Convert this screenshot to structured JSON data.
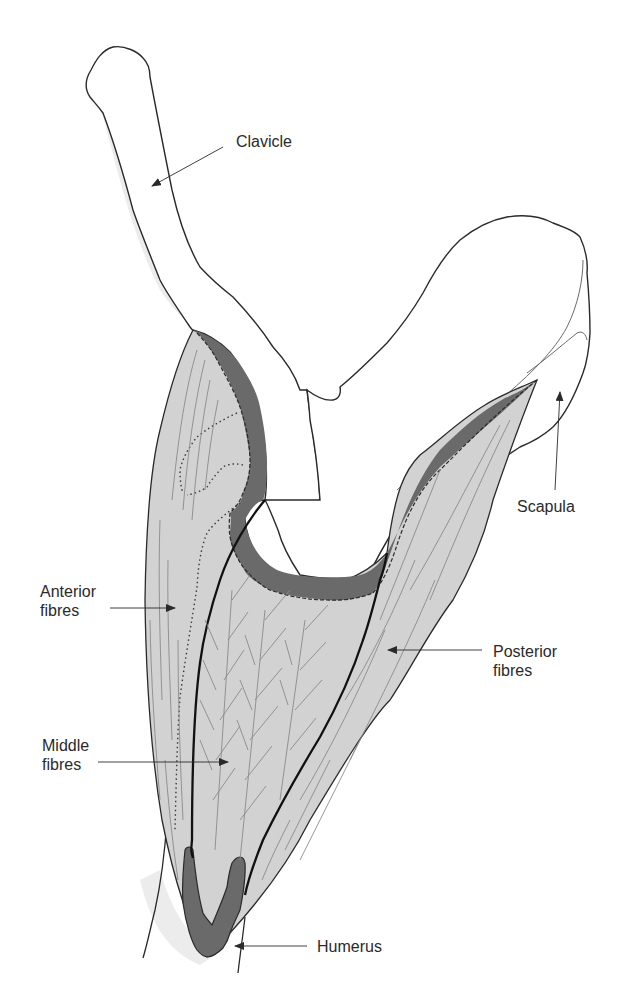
{
  "figure": {
    "colors": {
      "muscle_fill": "#d2d2d2",
      "tendon_fill": "#6a6a6a",
      "bone_fill": "#ffffff",
      "bone_shadow": "#ececec",
      "outline": "#2a2a2a",
      "fibre_line": "#8a8a8a",
      "label_text": "#2a2a2a"
    }
  },
  "labels": {
    "clavicle": "Clavicle",
    "scapula": "Scapula",
    "anterior_fibres": "Anterior\nfibres",
    "posterior_fibres": "Posterior\nfibres",
    "middle_fibres": "Middle\nfibres",
    "humerus": "Humerus"
  }
}
